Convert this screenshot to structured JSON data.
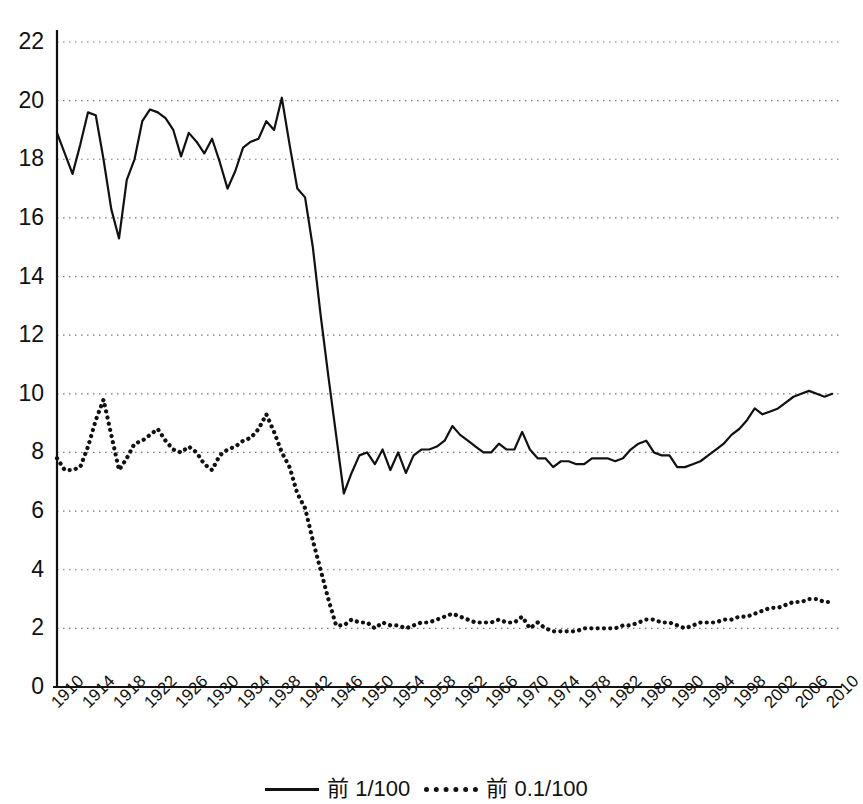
{
  "chart_data": {
    "type": "line",
    "title": "",
    "xlabel": "",
    "ylabel": "",
    "ylim": [
      0,
      22
    ],
    "xlim": [
      1910,
      2011
    ],
    "grid": "horizontal-dotted",
    "legend_position": "bottom-center",
    "ytick_labels": [
      "0",
      "2",
      "4",
      "6",
      "8",
      "10",
      "12",
      "14",
      "16",
      "18",
      "20",
      "22"
    ],
    "ytick_values": [
      0,
      2,
      4,
      6,
      8,
      10,
      12,
      14,
      16,
      18,
      20,
      22
    ],
    "xtick_labels": [
      "1910",
      "1914",
      "1918",
      "1922",
      "1926",
      "1930",
      "1934",
      "1938",
      "1942",
      "1946",
      "1950",
      "1954",
      "1958",
      "1962",
      "1966",
      "1970",
      "1974",
      "1978",
      "1982",
      "1986",
      "1990",
      "1994",
      "1998",
      "2002",
      "2006",
      "2010"
    ],
    "xtick_values": [
      1910,
      1914,
      1918,
      1922,
      1926,
      1930,
      1934,
      1938,
      1942,
      1946,
      1950,
      1954,
      1958,
      1962,
      1966,
      1970,
      1974,
      1978,
      1982,
      1986,
      1990,
      1994,
      1998,
      2002,
      2006,
      2010
    ],
    "legend": [
      {
        "name": "前 1/100",
        "style": "solid"
      },
      {
        "name": "前 0.1/100",
        "style": "dotted"
      }
    ],
    "series": [
      {
        "name": "前 1/100",
        "style": "solid",
        "x": [
          1910,
          1911,
          1912,
          1913,
          1914,
          1915,
          1916,
          1917,
          1918,
          1919,
          1920,
          1921,
          1922,
          1923,
          1924,
          1925,
          1926,
          1927,
          1928,
          1929,
          1930,
          1931,
          1932,
          1933,
          1934,
          1935,
          1936,
          1937,
          1938,
          1939,
          1940,
          1941,
          1942,
          1943,
          1944,
          1945,
          1946,
          1947,
          1948,
          1949,
          1950,
          1951,
          1952,
          1953,
          1954,
          1955,
          1956,
          1957,
          1958,
          1959,
          1960,
          1961,
          1962,
          1963,
          1964,
          1965,
          1966,
          1967,
          1968,
          1969,
          1970,
          1971,
          1972,
          1973,
          1974,
          1975,
          1976,
          1977,
          1978,
          1979,
          1980,
          1981,
          1982,
          1983,
          1984,
          1985,
          1986,
          1987,
          1988,
          1989,
          1990,
          1991,
          1992,
          1993,
          1994,
          1995,
          1996,
          1997,
          1998,
          1999,
          2000,
          2001,
          2002,
          2003,
          2004,
          2005,
          2006,
          2007,
          2008,
          2009,
          2010
        ],
        "y": [
          18.9,
          18.2,
          17.5,
          18.5,
          19.6,
          19.5,
          18.0,
          16.3,
          15.3,
          17.3,
          18.0,
          19.3,
          19.7,
          19.6,
          19.4,
          19.0,
          18.1,
          18.9,
          18.6,
          18.2,
          18.7,
          17.9,
          17.0,
          17.6,
          18.4,
          18.6,
          18.7,
          19.3,
          19.0,
          20.1,
          18.5,
          17.0,
          16.7,
          15.0,
          12.7,
          10.6,
          8.6,
          6.6,
          7.3,
          7.9,
          8.0,
          7.6,
          8.1,
          7.4,
          8.0,
          7.3,
          7.9,
          8.1,
          8.1,
          8.2,
          8.4,
          8.9,
          8.6,
          8.4,
          8.2,
          8.0,
          8.0,
          8.3,
          8.1,
          8.1,
          8.7,
          8.1,
          7.8,
          7.8,
          7.5,
          7.7,
          7.7,
          7.6,
          7.6,
          7.8,
          7.8,
          7.8,
          7.7,
          7.8,
          8.1,
          8.3,
          8.4,
          8.0,
          7.9,
          7.9,
          7.5,
          7.5,
          7.6,
          7.7,
          7.9,
          8.1,
          8.3,
          8.6,
          8.8,
          9.1,
          9.5,
          9.3,
          9.4,
          9.5,
          9.7,
          9.9,
          10.0,
          10.1,
          10.0,
          9.9,
          10.0
        ]
      },
      {
        "name": "前 0.1/100",
        "style": "dotted",
        "x": [
          1910,
          1911,
          1912,
          1913,
          1914,
          1915,
          1916,
          1917,
          1918,
          1919,
          1920,
          1921,
          1922,
          1923,
          1924,
          1925,
          1926,
          1927,
          1928,
          1929,
          1930,
          1931,
          1932,
          1933,
          1934,
          1935,
          1936,
          1937,
          1938,
          1939,
          1940,
          1941,
          1942,
          1943,
          1944,
          1945,
          1946,
          1947,
          1948,
          1949,
          1950,
          1951,
          1952,
          1953,
          1954,
          1955,
          1956,
          1957,
          1958,
          1959,
          1960,
          1961,
          1962,
          1963,
          1964,
          1965,
          1966,
          1967,
          1968,
          1969,
          1970,
          1971,
          1972,
          1973,
          1974,
          1975,
          1976,
          1977,
          1978,
          1979,
          1980,
          1981,
          1982,
          1983,
          1984,
          1985,
          1986,
          1987,
          1988,
          1989,
          1990,
          1991,
          1992,
          1993,
          1994,
          1995,
          1996,
          1997,
          1998,
          1999,
          2000,
          2001,
          2002,
          2003,
          2004,
          2005,
          2006,
          2007,
          2008,
          2009,
          2010
        ],
        "y": [
          7.8,
          7.4,
          7.4,
          7.5,
          8.2,
          9.1,
          9.8,
          8.6,
          7.4,
          7.8,
          8.3,
          8.4,
          8.6,
          8.8,
          8.4,
          8.1,
          8.0,
          8.2,
          8.0,
          7.6,
          7.4,
          7.9,
          8.1,
          8.2,
          8.4,
          8.5,
          8.8,
          9.3,
          8.7,
          8.0,
          7.5,
          6.6,
          6.1,
          5.0,
          4.0,
          3.0,
          2.1,
          2.1,
          2.3,
          2.2,
          2.2,
          2.0,
          2.2,
          2.1,
          2.1,
          2.0,
          2.1,
          2.2,
          2.2,
          2.3,
          2.4,
          2.5,
          2.4,
          2.3,
          2.2,
          2.2,
          2.2,
          2.3,
          2.2,
          2.2,
          2.4,
          2.0,
          2.2,
          2.0,
          1.9,
          1.9,
          1.9,
          1.9,
          2.0,
          2.0,
          2.0,
          2.0,
          2.0,
          2.1,
          2.1,
          2.2,
          2.3,
          2.3,
          2.2,
          2.2,
          2.1,
          2.0,
          2.1,
          2.2,
          2.2,
          2.2,
          2.3,
          2.3,
          2.4,
          2.4,
          2.5,
          2.6,
          2.7,
          2.7,
          2.8,
          2.9,
          2.9,
          3.0,
          3.0,
          2.9,
          2.9
        ]
      }
    ]
  },
  "colors": {
    "line": "#111111",
    "grid": "#777777",
    "axis": "#111111",
    "background": "#ffffff"
  }
}
